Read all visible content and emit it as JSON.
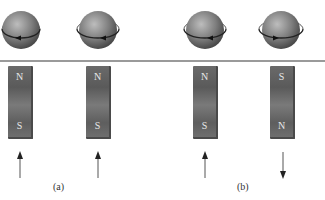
{
  "figure": {
    "divider_color": "#9a9a9a",
    "items": [
      {
        "rotation": "clockwise-front-left",
        "top_pole": "N",
        "bottom_pole": "S",
        "field_direction": "up",
        "panel": "a"
      },
      {
        "rotation": "clockwise-front-left",
        "top_pole": "N",
        "bottom_pole": "S",
        "field_direction": "up",
        "panel": "a"
      },
      {
        "rotation": "clockwise-front-left",
        "top_pole": "N",
        "bottom_pole": "S",
        "field_direction": "up",
        "panel": "b"
      },
      {
        "rotation": "counterclockwise-front-right",
        "top_pole": "S",
        "bottom_pole": "N",
        "field_direction": "down",
        "panel": "b"
      }
    ],
    "panel_labels": {
      "a": "(a)",
      "b": "(b)"
    },
    "icons": {
      "sphere": "spinning-sphere-icon",
      "magnet": "bar-magnet",
      "arrow_up": "arrow-up-icon",
      "arrow_down": "arrow-down-icon"
    }
  }
}
